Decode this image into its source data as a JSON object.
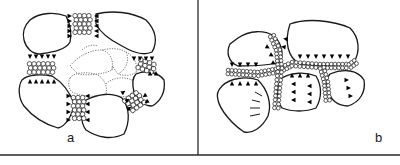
{
  "figure": {
    "panels": [
      {
        "id": "a",
        "label": "a"
      },
      {
        "id": "b",
        "label": "b"
      }
    ],
    "colors": {
      "ink": "#1a1a1a",
      "dashed_outline": "#7a7a7a",
      "background": "#ffffff"
    }
  }
}
